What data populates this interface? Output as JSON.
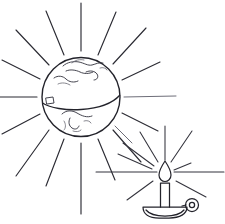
{
  "artwork": {
    "title": "Globe radiating light beside a lit candle",
    "medium": "pen and ink line drawing",
    "background_color": "#ffffff",
    "ink_color": "#23232b",
    "canvas": {
      "width": 225,
      "height": 224
    }
  },
  "globe": {
    "label": "Earth globe",
    "center_x": 81,
    "center_y": 97,
    "radius": 39,
    "outline_color": "#23232b",
    "equator_label": "equator line",
    "features": [
      "northern landmass sketch",
      "central island cluster",
      "southern continent sketch",
      "small square marking on west edge"
    ],
    "ray_count": 16,
    "ray_color": "#2b2b33"
  },
  "candle": {
    "label": "lit candle in dish holder",
    "center_x": 165,
    "flame_y": 172,
    "body_top_y": 181,
    "body_bottom_y": 207,
    "body_width": 9,
    "holder_label": "saucer candle holder with ring handle",
    "holder_y": 207,
    "ring_cx": 192,
    "ring_cy": 205,
    "ring_r": 6,
    "flame_label": "teardrop flame",
    "ray_count": 10,
    "ray_color": "#33333c"
  },
  "globe_rays": [
    {
      "angle": -90,
      "inner": 46,
      "outer": 96
    },
    {
      "angle": -68,
      "inner": 46,
      "outer": 94
    },
    {
      "angle": -46,
      "inner": 46,
      "outer": 92
    },
    {
      "angle": -24,
      "inner": 46,
      "outer": 88
    },
    {
      "angle": -112,
      "inner": 46,
      "outer": 94
    },
    {
      "angle": -134,
      "inner": 46,
      "outer": 92
    },
    {
      "angle": -156,
      "inner": 46,
      "outer": 86
    },
    {
      "angle": 180,
      "inner": 46,
      "outer": 84
    },
    {
      "angle": 0,
      "inner": 46,
      "outer": 94
    },
    {
      "angle": 22,
      "inner": 46,
      "outer": 88
    },
    {
      "angle": 45,
      "inner": 46,
      "outer": 60
    },
    {
      "angle": 68,
      "inner": 46,
      "outer": 86
    },
    {
      "angle": 90,
      "inner": 46,
      "outer": 94
    },
    {
      "angle": 112,
      "inner": 46,
      "outer": 94
    },
    {
      "angle": 134,
      "inner": 46,
      "outer": 92
    },
    {
      "angle": 158,
      "inner": 46,
      "outer": 88
    }
  ],
  "candle_rays": [
    {
      "angle": -90,
      "inner": 12,
      "outer": 48
    },
    {
      "angle": -62,
      "inner": 12,
      "outer": 46
    },
    {
      "angle": -118,
      "inner": 12,
      "outer": 44
    },
    {
      "angle": -145,
      "inner": 12,
      "outer": 42
    },
    {
      "angle": -158,
      "inner": 14,
      "outer": 40
    },
    {
      "angle": 180,
      "inner": 12,
      "outer": 70
    },
    {
      "angle": 0,
      "inner": 12,
      "outer": 60
    },
    {
      "angle": -36,
      "inner": 12,
      "outer": 44
    },
    {
      "angle": 32,
      "inner": 14,
      "outer": 42
    },
    {
      "angle": 148,
      "inner": 14,
      "outer": 42
    }
  ]
}
